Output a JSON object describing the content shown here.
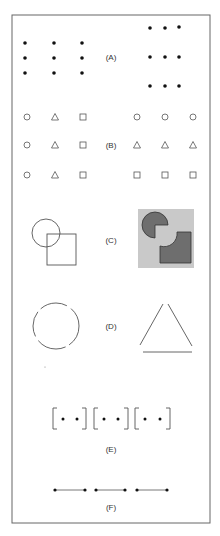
{
  "figure": {
    "frame": {
      "x": 12,
      "y": 15,
      "width": 198,
      "height": 508,
      "stroke": "#555555"
    },
    "panels": [
      {
        "id": "A",
        "label": "(A)",
        "label_pos": [
          111,
          57
        ],
        "description": "Proximity: evenly spaced 3x3 dots (left) vs dots grouped into rows (right)"
      },
      {
        "id": "B",
        "label": "(B)",
        "label_pos": [
          111,
          145
        ],
        "description": "Similarity: shapes grouped by column (left) vs by row (right)"
      },
      {
        "id": "C",
        "label": "(C)",
        "label_pos": [
          111,
          240
        ],
        "description": "Figure-ground / continuity: overlapping circle and square (left) vs pac-man style shapes on gray (right)"
      },
      {
        "id": "D",
        "label": "(D)",
        "label_pos": [
          111,
          326
        ],
        "description": "Closure: dashed circle (left) and triangle with gaps (right)"
      },
      {
        "id": "E",
        "label": "(E)",
        "label_pos": [
          111,
          449
        ],
        "description": "Enclosure: pairs of dots in brackets"
      },
      {
        "id": "F",
        "label": "(F)",
        "label_pos": [
          111,
          507
        ],
        "description": "Connectedness: pairs of dots connected by lines"
      }
    ],
    "colors": {
      "ink": "#111111",
      "stroke": "#555555",
      "gray_bg": "#c8c8c8",
      "dark_fill": "#6e6e6e"
    }
  }
}
